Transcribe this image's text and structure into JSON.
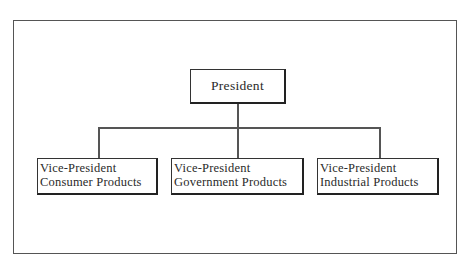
{
  "diagram": {
    "type": "org-chart",
    "root": {
      "label": "President"
    },
    "children": [
      {
        "line1": "Vice-President",
        "line2": "Consumer Products"
      },
      {
        "line1": "Vice-President",
        "line2": "Government Products"
      },
      {
        "line1": "Vice-President",
        "line2": "Industrial Products"
      }
    ],
    "colors": {
      "line": "#555555",
      "box_border": "#222222",
      "background": "#ffffff"
    }
  }
}
